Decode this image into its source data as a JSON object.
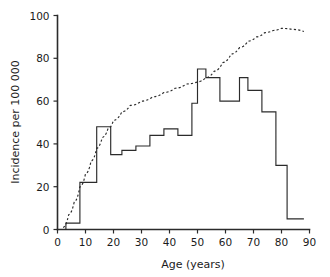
{
  "chart_data": {
    "type": "line",
    "title": "",
    "xlabel": "Age (years)",
    "ylabel": "Incidence per 100 000",
    "xlim": [
      0,
      90
    ],
    "ylim": [
      0,
      100
    ],
    "xticks": [
      0,
      10,
      20,
      30,
      40,
      50,
      60,
      70,
      80,
      90
    ],
    "yticks": [
      0,
      20,
      40,
      60,
      80,
      100
    ],
    "xtick_labels": [
      "0",
      "10",
      "20",
      "30",
      "40",
      "50",
      "60",
      "70",
      "80",
      "90"
    ],
    "ytick_labels": [
      "0",
      "20",
      "40",
      "60",
      "80",
      "100"
    ],
    "grid": false,
    "legend": "none",
    "colors": {
      "axis": "#2b2b2b",
      "incidence_step": "#2b2b2b",
      "cumulative_dashed": "#2b2b2b",
      "background": "#ffffff"
    },
    "series": [
      {
        "name": "Age-specific incidence",
        "style": "step",
        "line_style": "solid",
        "bin_edges": [
          3,
          8,
          14,
          19,
          23,
          28,
          33,
          38,
          43,
          48,
          50,
          53,
          58,
          60,
          65,
          68,
          73,
          78,
          82,
          88
        ],
        "values": [
          3,
          22,
          48,
          35,
          37,
          39,
          44,
          47,
          44,
          59,
          75,
          71,
          60,
          60,
          71,
          65,
          55,
          30,
          5,
          20
        ]
      },
      {
        "name": "Cumulative proportion",
        "style": "line",
        "line_style": "dashed",
        "x": [
          2,
          4,
          6,
          8,
          10,
          12,
          14,
          16,
          18,
          20,
          23,
          26,
          30,
          34,
          38,
          42,
          46,
          50,
          53,
          56,
          59,
          62,
          65,
          68,
          71,
          74,
          77,
          80,
          84,
          88
        ],
        "y": [
          1,
          7,
          13,
          20,
          26,
          32,
          38,
          43,
          47,
          51,
          55,
          58,
          60,
          62,
          64,
          66,
          68,
          69,
          71,
          74,
          78,
          82,
          85,
          88,
          90,
          92,
          93,
          94,
          93.5,
          92.5
        ]
      }
    ]
  },
  "axes": {
    "y_title": "Incidence per 100 000",
    "x_title": "Age (years)"
  }
}
